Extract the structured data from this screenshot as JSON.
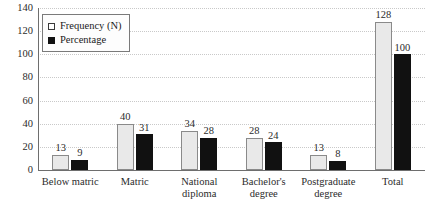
{
  "chart_data": {
    "type": "bar",
    "title": "",
    "subtitle": "",
    "xlabel": "",
    "ylabel": "",
    "ylim": [
      0,
      140
    ],
    "yticks": [
      0,
      20,
      40,
      60,
      80,
      100,
      120,
      140
    ],
    "grid": true,
    "legend_position": "top-left",
    "categories": [
      "Below matric",
      "Matric",
      "National diploma",
      "Bachelor's degree",
      "Postgraduate degree",
      "Total"
    ],
    "category_lines": [
      [
        "Below matric"
      ],
      [
        "Matric"
      ],
      [
        "National",
        "diploma"
      ],
      [
        "Bachelor's",
        "degree"
      ],
      [
        "Postgraduate",
        "degree"
      ],
      [
        "Total"
      ]
    ],
    "series": [
      {
        "name": "Frequency (N)",
        "color": "#e9e9e9",
        "border_color": "#8a8a8a",
        "values": [
          13,
          40,
          34,
          28,
          13,
          128
        ]
      },
      {
        "name": "Percentage",
        "color": "#111111",
        "border_color": "#111111",
        "values": [
          9,
          31,
          28,
          24,
          8,
          100
        ]
      }
    ]
  },
  "legend": {
    "items": [
      {
        "label": "Frequency (N)",
        "swatch": "freq"
      },
      {
        "label": "Percentage",
        "swatch": "pct"
      }
    ]
  }
}
